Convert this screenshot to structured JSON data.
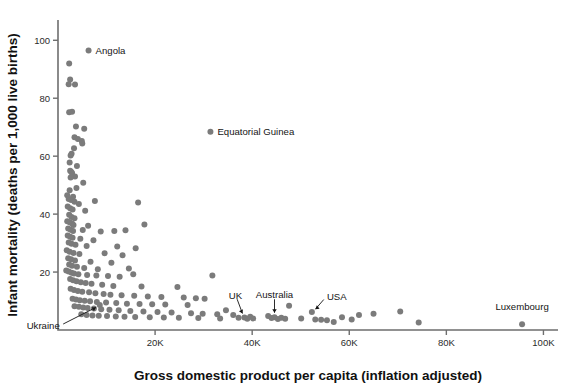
{
  "chart_data": {
    "type": "scatter",
    "title": "",
    "xlabel": "Gross domestic product per capita (inflation adjusted)",
    "ylabel": "Infant mortality (deaths per 1,000 live births)",
    "xlim": [
      0,
      103000
    ],
    "ylim": [
      0,
      107
    ],
    "grid": false,
    "legend": null,
    "xticks": [
      {
        "value": 20000,
        "label": "20K"
      },
      {
        "value": 40000,
        "label": "40K"
      },
      {
        "value": 60000,
        "label": "60K"
      },
      {
        "value": 80000,
        "label": "80K"
      },
      {
        "value": 100000,
        "label": "100K"
      }
    ],
    "yticks": [
      {
        "value": 20,
        "label": "20"
      },
      {
        "value": 40,
        "label": "40"
      },
      {
        "value": 60,
        "label": "60"
      },
      {
        "value": 80,
        "label": "80"
      },
      {
        "value": 100,
        "label": "100"
      }
    ],
    "point_color": "#7b7b7b",
    "point_radius": 3.0,
    "annotations": [
      {
        "name": "Angola",
        "x": 6300,
        "y": 96.5,
        "label_dx": 7,
        "label_dy": 3.2,
        "anchor": "start",
        "arrow": false
      },
      {
        "name": "Equatorial Guinea",
        "x": 31400,
        "y": 68.4,
        "label_dx": 7,
        "label_dy": 3.2,
        "anchor": "start",
        "arrow": false
      },
      {
        "name": "Ukraine",
        "x": 8600,
        "y": 8.6,
        "label_dx": -40,
        "label_dy": 24,
        "anchor": "end",
        "arrow": true
      },
      {
        "name": "UK",
        "x": 38400,
        "y": 4.3,
        "label_dx": -9,
        "label_dy": -19,
        "anchor": "middle",
        "arrow": true
      },
      {
        "name": "Australia",
        "x": 44600,
        "y": 4.4,
        "label_dx": 0,
        "label_dy": -19,
        "anchor": "middle",
        "arrow": true
      },
      {
        "name": "USA",
        "x": 52300,
        "y": 6.2,
        "label_dx": 15,
        "label_dy": -12,
        "anchor": "start",
        "arrow": true
      },
      {
        "name": "Luxembourg",
        "x": 95600,
        "y": 2.0,
        "label_dx": 0,
        "label_dy": -14,
        "anchor": "middle",
        "arrow": false
      }
    ],
    "points": [
      [
        6300,
        96.5
      ],
      [
        31400,
        68.4
      ],
      [
        2300,
        92.0
      ],
      [
        2500,
        86.5
      ],
      [
        2200,
        84.8
      ],
      [
        3500,
        84.7
      ],
      [
        2300,
        75.2
      ],
      [
        2900,
        75.3
      ],
      [
        3700,
        70.2
      ],
      [
        5400,
        69.5
      ],
      [
        3400,
        66.5
      ],
      [
        4100,
        65.9
      ],
      [
        4900,
        65.2
      ],
      [
        5000,
        64.4
      ],
      [
        3300,
        62.7
      ],
      [
        2800,
        60.8
      ],
      [
        2600,
        60.2
      ],
      [
        2400,
        57.8
      ],
      [
        3900,
        56.6
      ],
      [
        2500,
        55.0
      ],
      [
        2700,
        54.6
      ],
      [
        2900,
        54.2
      ],
      [
        3500,
        53.0
      ],
      [
        2600,
        52.6
      ],
      [
        5200,
        50.8
      ],
      [
        3800,
        49.0
      ],
      [
        2400,
        48.2
      ],
      [
        1900,
        46.5
      ],
      [
        3100,
        46.0
      ],
      [
        2200,
        45.2
      ],
      [
        2700,
        44.9
      ],
      [
        3400,
        44.3
      ],
      [
        4300,
        43.5
      ],
      [
        7600,
        44.5
      ],
      [
        16500,
        44.0
      ],
      [
        2000,
        42.6
      ],
      [
        2500,
        42.0
      ],
      [
        3000,
        41.6
      ],
      [
        5600,
        41.2
      ],
      [
        2300,
        39.8
      ],
      [
        2800,
        39.0
      ],
      [
        3400,
        38.6
      ],
      [
        1900,
        37.5
      ],
      [
        2400,
        37.2
      ],
      [
        2900,
        36.8
      ],
      [
        3200,
        36.2
      ],
      [
        6200,
        36.0
      ],
      [
        17800,
        36.4
      ],
      [
        2100,
        35.0
      ],
      [
        2600,
        34.6
      ],
      [
        3100,
        34.2
      ],
      [
        5100,
        34.5
      ],
      [
        8800,
        34.0
      ],
      [
        11600,
        34.2
      ],
      [
        13900,
        34.4
      ],
      [
        2000,
        32.6
      ],
      [
        2500,
        32.2
      ],
      [
        3000,
        31.8
      ],
      [
        4600,
        31.5
      ],
      [
        7300,
        31.0
      ],
      [
        2200,
        30.2
      ],
      [
        2800,
        29.8
      ],
      [
        3600,
        29.4
      ],
      [
        5900,
        29.0
      ],
      [
        12200,
        28.8
      ],
      [
        16000,
        28.2
      ],
      [
        1800,
        27.5
      ],
      [
        2400,
        27.0
      ],
      [
        3200,
        26.6
      ],
      [
        4400,
        26.2
      ],
      [
        9600,
        26.5
      ],
      [
        13300,
        25.8
      ],
      [
        2100,
        24.8
      ],
      [
        2700,
        24.4
      ],
      [
        3500,
        24.0
      ],
      [
        6700,
        23.6
      ],
      [
        11000,
        23.2
      ],
      [
        2300,
        22.6
      ],
      [
        2900,
        22.2
      ],
      [
        3900,
        21.8
      ],
      [
        5400,
        21.4
      ],
      [
        8200,
        21.0
      ],
      [
        14600,
        21.2
      ],
      [
        1700,
        20.5
      ],
      [
        2200,
        20.2
      ],
      [
        2800,
        19.8
      ],
      [
        3300,
        19.5
      ],
      [
        4200,
        19.2
      ],
      [
        6000,
        19.0
      ],
      [
        7900,
        18.8
      ],
      [
        10300,
        18.6
      ],
      [
        12700,
        18.4
      ],
      [
        15500,
        19.2
      ],
      [
        31800,
        18.8
      ],
      [
        2500,
        17.6
      ],
      [
        3100,
        17.2
      ],
      [
        3800,
        16.8
      ],
      [
        4700,
        16.5
      ],
      [
        5700,
        16.2
      ],
      [
        6900,
        16.0
      ],
      [
        9100,
        15.6
      ],
      [
        11400,
        15.2
      ],
      [
        17200,
        15.0
      ],
      [
        24600,
        14.8
      ],
      [
        2600,
        14.2
      ],
      [
        3300,
        13.8
      ],
      [
        4100,
        13.5
      ],
      [
        5000,
        13.2
      ],
      [
        6400,
        13.0
      ],
      [
        7700,
        12.7
      ],
      [
        9400,
        12.4
      ],
      [
        10800,
        12.2
      ],
      [
        13100,
        12.0
      ],
      [
        15700,
        11.8
      ],
      [
        18500,
        11.6
      ],
      [
        21300,
        11.4
      ],
      [
        25900,
        11.2
      ],
      [
        28400,
        11.0
      ],
      [
        30200,
        10.8
      ],
      [
        3000,
        10.8
      ],
      [
        3700,
        10.5
      ],
      [
        4500,
        10.3
      ],
      [
        5500,
        10.1
      ],
      [
        6600,
        9.9
      ],
      [
        8000,
        9.7
      ],
      [
        9900,
        9.5
      ],
      [
        12000,
        9.3
      ],
      [
        14200,
        9.1
      ],
      [
        16800,
        9.0
      ],
      [
        19400,
        8.9
      ],
      [
        22100,
        8.8
      ],
      [
        26700,
        8.6
      ],
      [
        8600,
        8.6
      ],
      [
        3400,
        8.2
      ],
      [
        4300,
        8.0
      ],
      [
        5200,
        7.8
      ],
      [
        6100,
        7.6
      ],
      [
        7400,
        7.4
      ],
      [
        8900,
        7.2
      ],
      [
        10600,
        7.0
      ],
      [
        12500,
        6.8
      ],
      [
        14900,
        6.6
      ],
      [
        17600,
        6.4
      ],
      [
        20500,
        6.2
      ],
      [
        23400,
        6.0
      ],
      [
        27400,
        5.8
      ],
      [
        29800,
        5.6
      ],
      [
        32800,
        5.4
      ],
      [
        34600,
        6.8
      ],
      [
        36100,
        5.2
      ],
      [
        52300,
        6.2
      ],
      [
        4800,
        5.4
      ],
      [
        5900,
        5.2
      ],
      [
        7100,
        5.0
      ],
      [
        8400,
        4.9
      ],
      [
        10100,
        4.8
      ],
      [
        11900,
        4.7
      ],
      [
        13700,
        4.6
      ],
      [
        15900,
        4.5
      ],
      [
        18900,
        4.4
      ],
      [
        21800,
        4.3
      ],
      [
        24900,
        4.2
      ],
      [
        28900,
        4.1
      ],
      [
        33400,
        4.0
      ],
      [
        37200,
        4.2
      ],
      [
        38400,
        4.3
      ],
      [
        39000,
        3.9
      ],
      [
        39600,
        4.6
      ],
      [
        40200,
        4.0
      ],
      [
        43300,
        4.8
      ],
      [
        44000,
        4.1
      ],
      [
        44600,
        4.4
      ],
      [
        45300,
        3.8
      ],
      [
        46000,
        4.2
      ],
      [
        46800,
        3.9
      ],
      [
        47600,
        8.4
      ],
      [
        50100,
        4.0
      ],
      [
        53000,
        3.6
      ],
      [
        54200,
        3.5
      ],
      [
        55400,
        3.4
      ],
      [
        56800,
        2.8
      ],
      [
        58500,
        4.4
      ],
      [
        60500,
        3.6
      ],
      [
        62000,
        5.2
      ],
      [
        65000,
        5.6
      ],
      [
        70500,
        6.4
      ],
      [
        74300,
        2.6
      ],
      [
        95600,
        2.0
      ]
    ]
  }
}
